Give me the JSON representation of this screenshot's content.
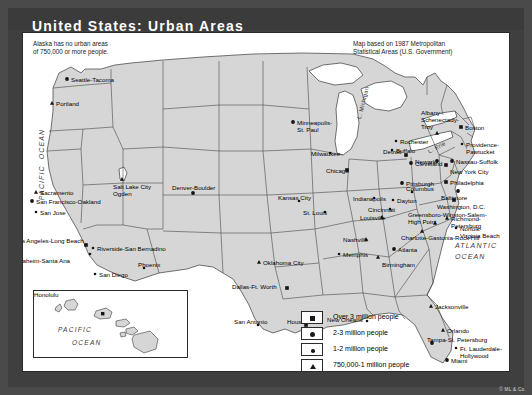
{
  "title": "United States: Urban Areas",
  "notes": {
    "alaska": "Alaska has no urban areas\nof 750,000 or more people.",
    "source": "Map based on 1987 Metropolitan\nStatistical Areas (U.S. Government)"
  },
  "colors": {
    "frame": "#4a4a4a",
    "title_bar": "#3b3b3b",
    "title_text": "#ffffff",
    "land": "#d6d6d6",
    "water": "#ffffff",
    "border": "#2a2a2a",
    "marker": "#141414"
  },
  "ocean_labels": {
    "pacific": "PACIFIC  OCEAN",
    "atlantic": "ATLANTIC\n    OCEAN",
    "inset_pacific": "PACIFIC",
    "inset_ocean": "OCEAN"
  },
  "lake_labels": {
    "michigan": "L. Michigan",
    "erie": "L. Erie"
  },
  "inset": {
    "name": "Hawaii",
    "city": "Honolulu"
  },
  "legend": {
    "items": [
      {
        "symbol": "square",
        "label": "Over 3 million people"
      },
      {
        "symbol": "large-dot",
        "label": "2-3 million people"
      },
      {
        "symbol": "small-dot",
        "label": "1-2 million people"
      },
      {
        "symbol": "triangle",
        "label": "750,000-1 million people"
      }
    ]
  },
  "credit": "© ML & Co.",
  "cities": [
    {
      "name": "Seattle-Tacoma",
      "class": "large-dot",
      "lx": 48,
      "ly": 43,
      "mx": 44,
      "my": 46
    },
    {
      "name": "Portland",
      "class": "triangle",
      "lx": 33,
      "ly": 67,
      "mx": 29,
      "my": 70
    },
    {
      "name": "Sacramento",
      "class": "triangle",
      "lx": 17,
      "ly": 156,
      "mx": 13,
      "my": 159
    },
    {
      "name": "San Francisco-Oakland",
      "class": "large-dot",
      "lx": 13,
      "ly": 165,
      "mx": 9,
      "my": 168
    },
    {
      "name": "San Jose",
      "class": "small-dot",
      "lx": 17,
      "ly": 176,
      "mx": 13,
      "my": 179
    },
    {
      "name": "Los Angeles-Long Beach",
      "class": "square",
      "lx": -8,
      "ly": 204,
      "mx": 63,
      "my": 212
    },
    {
      "name": "Anaheim-Santa Ana",
      "class": "small-dot",
      "lx": -8,
      "ly": 224,
      "mx": 67,
      "my": 221
    },
    {
      "name": "Riverside-San Bernadino",
      "class": "small-dot",
      "lx": 74,
      "ly": 212,
      "mx": 70,
      "my": 215
    },
    {
      "name": "San Diego",
      "class": "small-dot",
      "lx": 76,
      "ly": 238,
      "mx": 72,
      "my": 241
    },
    {
      "name": "Phoenix",
      "class": "small-dot",
      "lx": 115,
      "ly": 228,
      "mx": 121,
      "my": 235
    },
    {
      "name": "Salt Lake City\nOgden",
      "class": "triangle",
      "lx": 90,
      "ly": 150,
      "mx": 99,
      "my": 146
    },
    {
      "name": "Denver-Boulder",
      "class": "large-dot",
      "lx": 149,
      "ly": 151,
      "mx": 170,
      "my": 160
    },
    {
      "name": "Minneapolis-\nSt. Paul",
      "class": "large-dot",
      "lx": 274,
      "ly": 86,
      "mx": 270,
      "my": 89
    },
    {
      "name": "Milwaukee",
      "class": "small-dot",
      "lx": 288,
      "ly": 117,
      "mx": 307,
      "my": 120
    },
    {
      "name": "Chicago",
      "class": "square",
      "lx": 303,
      "ly": 134,
      "mx": 324,
      "my": 137
    },
    {
      "name": "Detroit",
      "class": "square",
      "lx": 360,
      "ly": 115,
      "mx": 383,
      "my": 122
    },
    {
      "name": "Cleveland",
      "class": "large-dot",
      "lx": 392,
      "ly": 127,
      "mx": 388,
      "my": 130
    },
    {
      "name": "Columbus",
      "class": "small-dot",
      "lx": 383,
      "ly": 152,
      "mx": 389,
      "my": 159
    },
    {
      "name": "Dayton",
      "class": "small-dot",
      "lx": 374,
      "ly": 164,
      "mx": 370,
      "my": 167
    },
    {
      "name": "Cincinnati",
      "class": "small-dot",
      "lx": 345,
      "ly": 173,
      "mx": 367,
      "my": 176
    },
    {
      "name": "Indianapolis",
      "class": "small-dot",
      "lx": 330,
      "ly": 162,
      "mx": 351,
      "my": 165
    },
    {
      "name": "Kansas City",
      "class": "small-dot",
      "lx": 255,
      "ly": 161,
      "mx": 276,
      "my": 168
    },
    {
      "name": "St. Louis",
      "class": "small-dot",
      "lx": 280,
      "ly": 176,
      "mx": 302,
      "my": 179
    },
    {
      "name": "Louisville",
      "class": "triangle",
      "lx": 337,
      "ly": 181,
      "mx": 359,
      "my": 184
    },
    {
      "name": "Nashville",
      "class": "triangle",
      "lx": 320,
      "ly": 203,
      "mx": 343,
      "my": 206
    },
    {
      "name": "Memphis",
      "class": "small-dot",
      "lx": 320,
      "ly": 218,
      "mx": 316,
      "my": 221
    },
    {
      "name": "Oklahoma City",
      "class": "triangle",
      "lx": 240,
      "ly": 226,
      "mx": 236,
      "my": 229
    },
    {
      "name": "Dallas-Ft. Worth",
      "class": "square",
      "lx": 209,
      "ly": 250,
      "mx": 264,
      "my": 255
    },
    {
      "name": "San Antonio",
      "class": "small-dot",
      "lx": 211,
      "ly": 285,
      "mx": 235,
      "my": 292
    },
    {
      "name": "Houston",
      "class": "square",
      "lx": 264,
      "ly": 285,
      "mx": 283,
      "my": 292
    },
    {
      "name": "New Orleans",
      "class": "small-dot",
      "lx": 304,
      "ly": 283,
      "mx": 344,
      "my": 288
    },
    {
      "name": "Birmingham",
      "class": "triangle",
      "lx": 359,
      "ly": 228,
      "mx": 355,
      "my": 224
    },
    {
      "name": "Atlanta",
      "class": "large-dot",
      "lx": 375,
      "ly": 213,
      "mx": 371,
      "my": 216
    },
    {
      "name": "Charlotte-Gastonia-Rock Hill",
      "class": "triangle",
      "lx": 378,
      "ly": 201,
      "mx": 399,
      "my": 198
    },
    {
      "name": "Greensboro-Winston-Salem-\nHigh Point",
      "class": "triangle",
      "lx": 385,
      "ly": 178,
      "mx": 412,
      "my": 190
    },
    {
      "name": "Jacksonville",
      "class": "triangle",
      "lx": 412,
      "ly": 270,
      "mx": 408,
      "my": 273
    },
    {
      "name": "Orlando",
      "class": "triangle",
      "lx": 424,
      "ly": 294,
      "mx": 420,
      "my": 297
    },
    {
      "name": "Tampa-St. Petersburg",
      "class": "large-dot",
      "lx": 404,
      "ly": 303,
      "mx": 409,
      "my": 310
    },
    {
      "name": "Ft. Lauderdale-\nHollywood",
      "class": "small-dot",
      "lx": 437,
      "ly": 312,
      "mx": 433,
      "my": 315
    },
    {
      "name": "Miami",
      "class": "large-dot",
      "lx": 428,
      "ly": 324,
      "mx": 424,
      "my": 327
    },
    {
      "name": "Richmond-Petersburg",
      "class": "triangle",
      "lx": 428,
      "ly": 182,
      "mx": 424,
      "my": 185
    },
    {
      "name": "Norfolk-\nVirginia Beach",
      "class": "small-dot",
      "lx": 437,
      "ly": 192,
      "mx": 433,
      "my": 195
    },
    {
      "name": "Washington, D.C.",
      "class": "square",
      "lx": 414,
      "ly": 170,
      "mx": 431,
      "my": 167
    },
    {
      "name": "Baltimore",
      "class": "large-dot",
      "lx": 418,
      "ly": 161,
      "mx": 435,
      "my": 158
    },
    {
      "name": "Philadelphia",
      "class": "square",
      "lx": 427,
      "ly": 146,
      "mx": 423,
      "my": 149
    },
    {
      "name": "New York City",
      "class": "square",
      "lx": 427,
      "ly": 135,
      "mx": 423,
      "my": 132
    },
    {
      "name": "Nassau-Suffolk",
      "class": "large-dot",
      "lx": 433,
      "ly": 125,
      "mx": 429,
      "my": 128
    },
    {
      "name": "Newark",
      "class": "large-dot",
      "lx": 392,
      "ly": 125,
      "mx": 414,
      "my": 128
    },
    {
      "name": "Providence-\nPawtucket",
      "class": "small-dot",
      "lx": 443,
      "ly": 108,
      "mx": 439,
      "my": 111
    },
    {
      "name": "Boston",
      "class": "square",
      "lx": 442,
      "ly": 91,
      "mx": 438,
      "my": 94
    },
    {
      "name": "Albany-\nSchenectady-\nTroy",
      "class": "triangle",
      "lx": 398,
      "ly": 76,
      "mx": 414,
      "my": 100
    },
    {
      "name": "Rochester",
      "class": "small-dot",
      "lx": 377,
      "ly": 105,
      "mx": 373,
      "my": 108
    },
    {
      "name": "Buffalo",
      "class": "small-dot",
      "lx": 373,
      "ly": 114,
      "mx": 369,
      "my": 117
    },
    {
      "name": "Pittsburgh",
      "class": "large-dot",
      "lx": 383,
      "ly": 147,
      "mx": 379,
      "my": 150
    }
  ]
}
